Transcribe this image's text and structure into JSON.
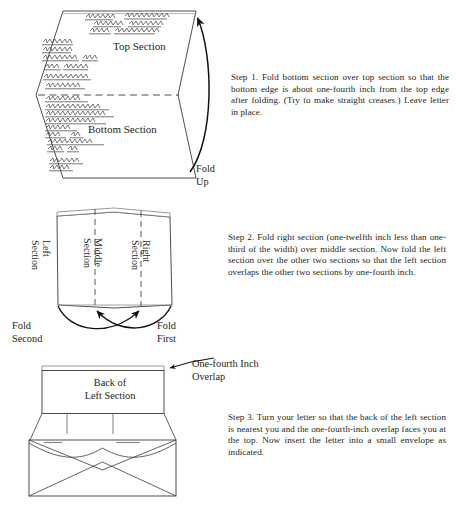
{
  "document": {
    "title": "How to Fold a Letter"
  },
  "steps": [
    {
      "id": "step-1",
      "text": "Step 1.   Fold bottom section over top section so that the bottom edge is about one-fourth inch from the top edge after folding. (Try to make straight creases.) Leave letter in place."
    },
    {
      "id": "step-2",
      "text": "Step 2.   Fold right section (one-twelfth inch less than one-third of the width) over middle section. Now fold the left section over the other two sections so that the left section overlaps the other two sections by one-fourth inch."
    },
    {
      "id": "step-3",
      "text": "Step 3.   Turn your letter so that the back of the left section is nearest you and the one-fourth-inch overlap faces you at the top. Now insert the letter into a small envelope as indicated."
    }
  ],
  "figure1": {
    "name": "unfolded-letter",
    "top_section_label": "Top Section",
    "bottom_section_label": "Bottom Section",
    "fold_up_label": "Fold\nUp"
  },
  "figure2": {
    "name": "three-section-letter",
    "left_section_label": "Left\nSection",
    "middle_section_label": "Middle\nSection",
    "right_section_label": "Right\nSection",
    "fold_second_label": "Fold\nSecond",
    "fold_first_label": "Fold\nFirst"
  },
  "figure3": {
    "name": "letter-and-envelope",
    "overlap_label": "One-fourth Inch\nOverlap",
    "back_of_left_label": "Back of\nLeft Section"
  },
  "colors": {
    "ink": "#231f20",
    "line": "#3a3a3a",
    "paper": "#ffffff",
    "scribble": "#4a4a4a"
  }
}
